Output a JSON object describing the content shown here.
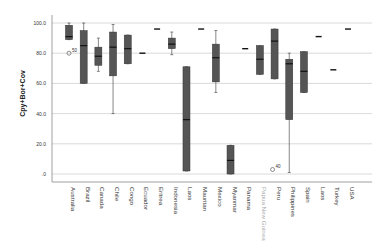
{
  "chart_data": {
    "type": "boxplot",
    "title": "",
    "xlabel": "",
    "ylabel": "Cpy+Bor+Cov",
    "ylim": [
      0,
      100
    ],
    "yticks": [
      "100.0",
      "80.0",
      "60.0",
      "40.0",
      "20.0",
      ".0"
    ],
    "grid": true,
    "colors": {
      "box": "#555555",
      "median": "#111111",
      "grid": "#d0d0d0",
      "axis": "#888888",
      "text": "#333333"
    },
    "categories": [
      "Australia",
      "Brazil",
      "Canada",
      "Chile",
      "Congo",
      "Ecuador",
      "Eritrea",
      "Indonesia",
      "Laos",
      "Mauritan",
      "Mexico",
      "Myanmar",
      "Panama",
      "Papua New Guinea",
      "Peru",
      "Philippines",
      "Spain",
      "Laos",
      "Turkey",
      "USA"
    ],
    "boxes": [
      {
        "name": "Australia",
        "whisker_high": 100,
        "q3": 98.5,
        "median": 91,
        "q1": 89,
        "whisker_low": 89,
        "outliers": [
          {
            "value": 80,
            "label": "50"
          }
        ]
      },
      {
        "name": "Brazil",
        "whisker_high": 100,
        "q3": 95,
        "median": 85,
        "q1": 60,
        "whisker_low": 60,
        "outliers": []
      },
      {
        "name": "Canada",
        "whisker_high": 90,
        "q3": 84,
        "median": 78,
        "q1": 72,
        "whisker_low": 68,
        "outliers": []
      },
      {
        "name": "Chile",
        "whisker_high": 99,
        "q3": 94,
        "median": 84,
        "q1": 65,
        "whisker_low": 40,
        "outliers": []
      },
      {
        "name": "Congo",
        "whisker_high": 92,
        "q3": 92,
        "median": 83,
        "q1": 73,
        "whisker_low": 73,
        "outliers": []
      },
      {
        "name": "Ecuador",
        "whisker_high": 80,
        "q3": 80,
        "median": 80,
        "q1": 80,
        "whisker_low": 80,
        "outliers": []
      },
      {
        "name": "Eritrea",
        "whisker_high": 96,
        "q3": 96,
        "median": 96,
        "q1": 96,
        "whisker_low": 96,
        "outliers": []
      },
      {
        "name": "Indonesia",
        "whisker_high": 94,
        "q3": 90,
        "median": 86,
        "q1": 83,
        "whisker_low": 79,
        "outliers": []
      },
      {
        "name": "Laos",
        "whisker_high": 71,
        "q3": 71,
        "median": 36,
        "q1": 2,
        "whisker_low": 2,
        "outliers": []
      },
      {
        "name": "Mauritan",
        "whisker_high": 96,
        "q3": 96,
        "median": 96,
        "q1": 96,
        "whisker_low": 96,
        "outliers": []
      },
      {
        "name": "Mexico",
        "whisker_high": 95,
        "q3": 86,
        "median": 77,
        "q1": 61,
        "whisker_low": 54,
        "outliers": []
      },
      {
        "name": "Myanmar",
        "whisker_high": 19,
        "q3": 19,
        "median": 9,
        "q1": 0,
        "whisker_low": 0,
        "outliers": []
      },
      {
        "name": "Panama",
        "whisker_high": 83,
        "q3": 83,
        "median": 83,
        "q1": 83,
        "whisker_low": 83,
        "outliers": []
      },
      {
        "name": "Papua New Guinea",
        "whisker_high": 85,
        "q3": 85,
        "median": 76,
        "q1": 66,
        "whisker_low": 66,
        "outliers": []
      },
      {
        "name": "Peru",
        "whisker_high": 96,
        "q3": 96,
        "median": 88,
        "q1": 63,
        "whisker_low": 63,
        "outliers": [
          {
            "value": 3,
            "label": "40"
          }
        ]
      },
      {
        "name": "Philippines",
        "whisker_high": 80,
        "q3": 76,
        "median": 73,
        "q1": 36,
        "whisker_low": 1,
        "outliers": []
      },
      {
        "name": "Spain",
        "whisker_high": 81,
        "q3": 81,
        "median": 68,
        "q1": 54,
        "whisker_low": 54,
        "outliers": []
      },
      {
        "name": "Laos",
        "whisker_high": 91,
        "q3": 91,
        "median": 91,
        "q1": 91,
        "whisker_low": 91,
        "outliers": []
      },
      {
        "name": "Turkey",
        "whisker_high": 69,
        "q3": 69,
        "median": 69,
        "q1": 69,
        "whisker_low": 69,
        "outliers": []
      },
      {
        "name": "USA",
        "whisker_high": 96,
        "q3": 96,
        "median": 96,
        "q1": 96,
        "whisker_low": 96,
        "outliers": []
      }
    ]
  }
}
